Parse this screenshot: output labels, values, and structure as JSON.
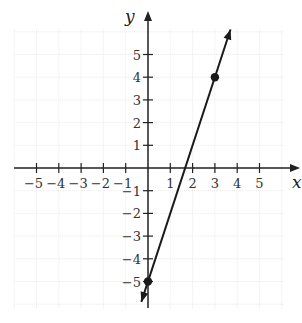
{
  "chart_data": {
    "type": "line",
    "title": "",
    "xlabel": "x",
    "ylabel": "y",
    "xlim": [
      -5,
      5
    ],
    "ylim": [
      -5,
      5
    ],
    "grid": true,
    "x_ticks": [
      -5,
      -4,
      -3,
      -2,
      -1,
      1,
      2,
      3,
      4,
      5
    ],
    "y_ticks": [
      -5,
      -4,
      -3,
      -2,
      -1,
      1,
      2,
      3,
      4,
      5
    ],
    "x_tick_labels": [
      "−5",
      "−4",
      "−3",
      "−2",
      "−1",
      "1",
      "2",
      "3",
      "4",
      "5"
    ],
    "y_tick_labels": [
      "−5",
      "−4",
      "−3",
      "−2",
      "−1",
      "1",
      "2",
      "3",
      "4",
      "5"
    ],
    "series": [
      {
        "name": "line",
        "equation": "y = 3x - 5",
        "slope": 3,
        "intercept": -5,
        "points": [
          {
            "x": 0,
            "y": -5
          },
          {
            "x": 3,
            "y": 4
          }
        ],
        "arrows_both_ends": true,
        "extent": {
          "x": [
            -0.3,
            3.7
          ],
          "y": [
            -5.9,
            6.1
          ]
        }
      }
    ],
    "legend": null
  },
  "style": {
    "axis_color": "#222222",
    "line_color": "#1a1a1a",
    "grid_color": "#e9e9e9"
  }
}
